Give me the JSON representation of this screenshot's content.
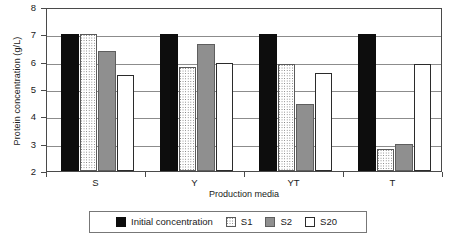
{
  "chart_data": {
    "type": "bar",
    "title": "",
    "xlabel": "Production media",
    "ylabel": "Protein concentration (g/L)",
    "categories": [
      "S",
      "Y",
      "YT",
      "T"
    ],
    "ylim": [
      2,
      8
    ],
    "yticks": [
      2,
      3,
      4,
      5,
      6,
      7,
      8
    ],
    "ytick_labels": [
      "2",
      "3",
      "4",
      "5",
      "6",
      "7",
      "8"
    ],
    "grid": true,
    "legend_position": "bottom",
    "series": [
      {
        "name": "Initial concentration",
        "key": "initial",
        "color": "#0d0d0d",
        "values": [
          7.0,
          7.0,
          7.0,
          7.0
        ]
      },
      {
        "name": "S1",
        "key": "s1",
        "color": "#ffffff",
        "values": [
          7.0,
          5.8,
          5.9,
          2.8
        ]
      },
      {
        "name": "S2",
        "key": "s2",
        "color": "#8f8f8f",
        "values": [
          6.4,
          6.65,
          4.45,
          3.0
        ]
      },
      {
        "name": "S20",
        "key": "s20",
        "color": "#ffffff",
        "values": [
          5.5,
          5.95,
          5.6,
          5.9
        ]
      }
    ]
  }
}
